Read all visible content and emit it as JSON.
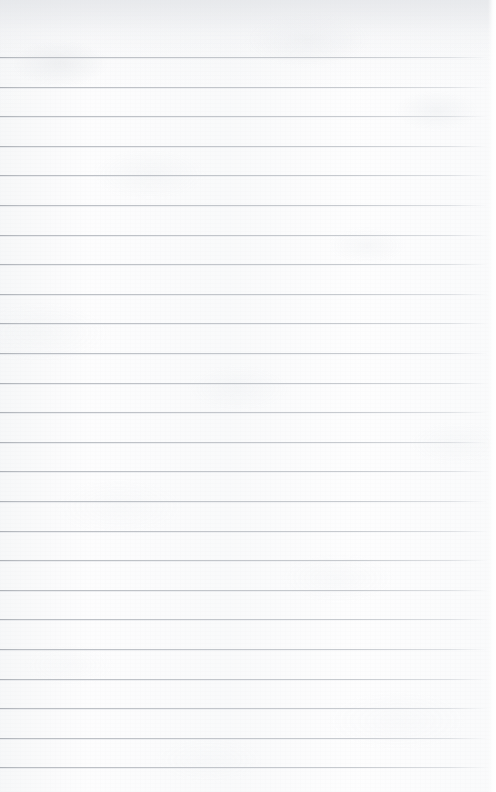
{
  "document": {
    "kind": "ruled-notebook-paper",
    "title": "",
    "body_text": "",
    "is_blank": true,
    "page_number": "",
    "header_text": "",
    "footer_text": ""
  },
  "sheet": {
    "width_px": 496,
    "height_px": 792,
    "paper_color": "#fdfdfd",
    "paper_shade_color": "#e6e8eb",
    "texture": "subtle-mottled-grain"
  },
  "ruling": {
    "line_color": "#b6b9be",
    "line_color_dark": "#aaaeb4",
    "line_thickness_px": 1,
    "first_line_y": 57,
    "line_spacing_px": 29.6,
    "line_count": 25,
    "left_inset_px": 0,
    "right_fade_start_px": 456,
    "right_inset_px": 8,
    "has_vertical_margin_rule": false,
    "line_y_positions": [
      57,
      86.6,
      116.2,
      145.8,
      175.4,
      205,
      234.6,
      264.2,
      293.8,
      323.4,
      353,
      382.6,
      412.2,
      441.8,
      471.4,
      501,
      530.6,
      560.2,
      589.8,
      619.4,
      649,
      678.6,
      708.2,
      737.8,
      767.4
    ]
  }
}
